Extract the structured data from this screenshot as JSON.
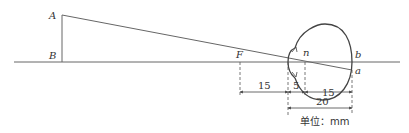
{
  "diagram": {
    "type": "reduced-eye optics diagram",
    "points": {
      "A": "A",
      "B": "B",
      "F": "F",
      "n": "n",
      "b": "b",
      "a": "a"
    },
    "dimensions": {
      "F_to_cornea": "15",
      "cornea_to_n": "5",
      "n_to_retina": "15",
      "cornea_to_retina": "20"
    },
    "unit_label": "单位：mm",
    "colors": {
      "line": "#555555",
      "text": "#333333"
    }
  }
}
